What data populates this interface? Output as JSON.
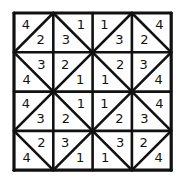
{
  "diagram": {
    "title": "",
    "grid": {
      "rows": 4,
      "cols": 4,
      "origin": [
        14,
        13
      ],
      "cell_size": 39.3,
      "line_color": "#111111",
      "background": "#ffffff"
    },
    "cells": [
      [
        {
          "diag": "tr-bl",
          "a": "4",
          "b": "2"
        },
        {
          "diag": "tl-br",
          "a": "1",
          "b": "3"
        },
        {
          "diag": "tr-bl",
          "a": "1",
          "b": "3"
        },
        {
          "diag": "tl-br",
          "a": "4",
          "b": "2"
        }
      ],
      [
        {
          "diag": "tl-br",
          "a": "3",
          "b": "4"
        },
        {
          "diag": "tr-bl",
          "a": "2",
          "b": "1"
        },
        {
          "diag": "tl-br",
          "a": "2",
          "b": "1"
        },
        {
          "diag": "tr-bl",
          "a": "3",
          "b": "4"
        }
      ],
      [
        {
          "diag": "tr-bl",
          "a": "4",
          "b": "3"
        },
        {
          "diag": "tl-br",
          "a": "1",
          "b": "2"
        },
        {
          "diag": "tr-bl",
          "a": "1",
          "b": "2"
        },
        {
          "diag": "tl-br",
          "a": "4",
          "b": "3"
        }
      ],
      [
        {
          "diag": "tl-br",
          "a": "2",
          "b": "4"
        },
        {
          "diag": "tr-bl",
          "a": "3",
          "b": "1"
        },
        {
          "diag": "tl-br",
          "a": "3",
          "b": "1"
        },
        {
          "diag": "tr-bl",
          "a": "2",
          "b": "4"
        }
      ]
    ]
  }
}
